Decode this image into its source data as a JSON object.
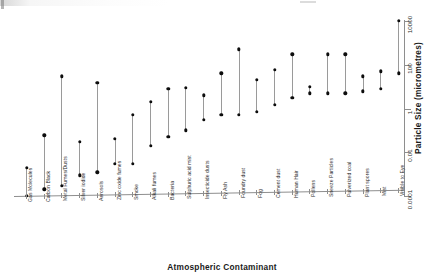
{
  "figure": {
    "background_color": "#ffffff",
    "axis_color": "#8e8e8e",
    "marker_color": "#0d0d0d",
    "line_color": "#9a9a9a"
  },
  "chart_data": {
    "type": "range",
    "title": "",
    "subtitle": "",
    "xlabel": "Atmospheric Contaminant",
    "ylabel": "Particle Size (micrometres)",
    "yscale": "log",
    "ylim": [
      0.0001,
      10000
    ],
    "ytick_values": [
      0.0001,
      0.01,
      1,
      100,
      10000
    ],
    "ytick_labels": [
      "0.0001",
      "0.01",
      "1",
      "100",
      "10000"
    ],
    "yaxis_position": "right",
    "xaxis_position": "bottom",
    "grid": false,
    "legend": false,
    "xtick_labels_rotation": -90,
    "categories": [
      "Gas Molecules",
      "Carbon Black",
      "Metal Fumes/Dusts",
      "Silver iodide",
      "Aerosols",
      "Zinc oxide fumes",
      "Smoke",
      "Alkali fumes",
      "Bacteria",
      "Sulphuric acid mist",
      "Insecticide dusts",
      "Fly Ash",
      "Foundry dust",
      "Fog",
      "Cement dust",
      "Human Hair",
      "Pollens",
      "Sneeze Particles",
      "Pulverized coal",
      "Plant spores",
      "Mist",
      "Visible to Eye"
    ],
    "series": [
      {
        "name": "minimum size",
        "values": [
          0.0001,
          0.0002,
          0.0003,
          0.0009,
          0.0012,
          0.003,
          0.003,
          0.02,
          0.05,
          0.1,
          0.3,
          0.5,
          0.5,
          0.7,
          1.5,
          3,
          5,
          5,
          5,
          6,
          8,
          40
        ]
      },
      {
        "name": "maximum size",
        "values": [
          0.002,
          0.06,
          30,
          0.07,
          15,
          0.1,
          0.5,
          2,
          8,
          9,
          4,
          40,
          500,
          20,
          60,
          300,
          10,
          300,
          300,
          30,
          50,
          10000
        ]
      }
    ],
    "ranges": [
      {
        "category": "Gas Molecules",
        "min": 0.0001,
        "max": 0.002
      },
      {
        "category": "Carbon Black",
        "min": 0.0002,
        "max": 0.06
      },
      {
        "category": "Metal Fumes/Dusts",
        "min": 0.0003,
        "max": 30
      },
      {
        "category": "Silver iodide",
        "min": 0.0009,
        "max": 0.03
      },
      {
        "category": "Aerosols",
        "min": 0.0012,
        "max": 15
      },
      {
        "category": "Zinc oxide fumes",
        "min": 0.003,
        "max": 0.04
      },
      {
        "category": "Smoke",
        "min": 0.003,
        "max": 0.5
      },
      {
        "category": "Alkali fumes",
        "min": 0.02,
        "max": 2
      },
      {
        "category": "Bacteria",
        "min": 0.05,
        "max": 8
      },
      {
        "category": "Sulphuric acid mist",
        "min": 0.1,
        "max": 9
      },
      {
        "category": "Insecticide dusts",
        "min": 0.3,
        "max": 4
      },
      {
        "category": "Fly Ash",
        "min": 0.5,
        "max": 40
      },
      {
        "category": "Foundry dust",
        "min": 0.5,
        "max": 500
      },
      {
        "category": "Fog",
        "min": 0.7,
        "max": 20
      },
      {
        "category": "Cement dust",
        "min": 1.5,
        "max": 60
      },
      {
        "category": "Human Hair",
        "min": 3,
        "max": 300
      },
      {
        "category": "Pollens",
        "min": 5,
        "max": 10
      },
      {
        "category": "Sneeze Particles",
        "min": 5,
        "max": 300
      },
      {
        "category": "Pulverized coal",
        "min": 5,
        "max": 300
      },
      {
        "category": "Plant spores",
        "min": 6,
        "max": 30
      },
      {
        "category": "Mist",
        "min": 8,
        "max": 50
      },
      {
        "category": "Visible to Eye",
        "min": 40,
        "max": 10000
      }
    ]
  }
}
